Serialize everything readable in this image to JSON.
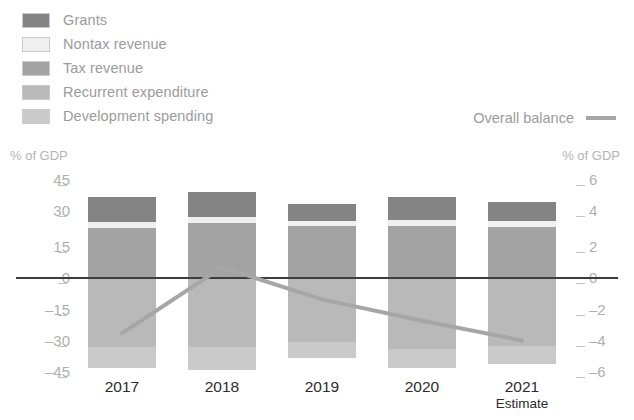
{
  "legend": {
    "items": [
      {
        "label": "Grants",
        "color": "#848484",
        "key": "grants"
      },
      {
        "label": "Nontax revenue",
        "color": "#efefef",
        "key": "nontax"
      },
      {
        "label": "Tax revenue",
        "color": "#a3a3a3",
        "key": "tax"
      },
      {
        "label": "Recurrent expenditure",
        "color": "#b9b9b9",
        "key": "recurrent"
      },
      {
        "label": "Development spending",
        "color": "#cacaca",
        "key": "development"
      }
    ],
    "line_label": "Overall balance",
    "line_color": "#a6a6a6"
  },
  "axes": {
    "left_caption": "% of GDP",
    "right_caption": "% of GDP",
    "left_ticks": [
      "45",
      "30",
      "15",
      "0",
      "–15",
      "–30",
      "–45"
    ],
    "right_ticks": [
      "6",
      "4",
      "2",
      "0",
      "–2",
      "–4",
      "–6"
    ]
  },
  "chart_data": {
    "type": "bar",
    "title": "",
    "subtitle": "",
    "xlabel": "",
    "ylabel": "% of GDP",
    "y2label": "% of GDP",
    "ylim": [
      -45,
      45
    ],
    "y2lim": [
      -6,
      6
    ],
    "grid": false,
    "legend_position": "top-left",
    "categories": [
      "2017",
      "2018",
      "2019",
      "2020",
      "2021"
    ],
    "category_sublabels": [
      "",
      "",
      "",
      "",
      "Estimate"
    ],
    "stacking": "revenue above zero, expenditure below zero",
    "series": [
      {
        "name": "Tax revenue",
        "axis": "left",
        "stack": "revenue",
        "values": [
          21.0,
          23.0,
          22.0,
          22.0,
          21.5
        ]
      },
      {
        "name": "Nontax revenue",
        "axis": "left",
        "stack": "revenue",
        "values": [
          2.5,
          2.5,
          2.0,
          2.5,
          2.5
        ]
      },
      {
        "name": "Grants",
        "axis": "left",
        "stack": "revenue",
        "values": [
          10.5,
          10.5,
          7.0,
          9.5,
          8.0
        ]
      },
      {
        "name": "Recurrent expenditure",
        "axis": "left",
        "stack": "expenditure",
        "values": [
          -29.0,
          -29.0,
          -27.0,
          -30.0,
          -28.5
        ]
      },
      {
        "name": "Development spending",
        "axis": "left",
        "stack": "expenditure",
        "values": [
          -9.0,
          -9.5,
          -6.5,
          -8.0,
          -7.5
        ]
      }
    ],
    "line_series": {
      "name": "Overall balance",
      "axis": "right",
      "unit": "% of GDP",
      "values": [
        -3.1,
        0.6,
        -1.2,
        -2.4,
        -3.5
      ]
    }
  }
}
